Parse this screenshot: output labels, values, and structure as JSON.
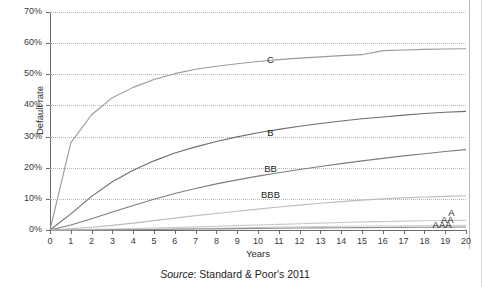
{
  "figure": {
    "source_prefix": "Source",
    "source_text": ": Standard & Poor's 2011"
  },
  "chart_data": {
    "type": "line",
    "title": "",
    "xlabel": "Years",
    "ylabel": "Default rate",
    "xlim": [
      0,
      20
    ],
    "ylim": [
      0,
      70
    ],
    "grid": true,
    "legend": "inline-labels",
    "x_ticks": [
      "0",
      "1",
      "2",
      "3",
      "4",
      "5",
      "6",
      "7",
      "8",
      "9",
      "10",
      "11",
      "12",
      "13",
      "14",
      "15",
      "16",
      "17",
      "18",
      "19",
      "20"
    ],
    "y_ticks": [
      "0%",
      "10%",
      "20%",
      "30%",
      "40%",
      "50%",
      "60%",
      "70%"
    ],
    "x": [
      0,
      1,
      2,
      3,
      4,
      5,
      6,
      7,
      8,
      9,
      10,
      11,
      12,
      13,
      14,
      15,
      16,
      17,
      18,
      19,
      20
    ],
    "series": [
      {
        "name": "C",
        "label": "C",
        "color": "#9a9a9a",
        "label_x": 10.6,
        "label_y": 54.5,
        "values": [
          0,
          28.0,
          37.0,
          42.5,
          45.8,
          48.3,
          50.2,
          51.6,
          52.6,
          53.4,
          54.1,
          54.7,
          55.2,
          55.6,
          56.0,
          56.3,
          57.6,
          57.8,
          58.0,
          58.1,
          58.2
        ]
      },
      {
        "name": "B",
        "label": "B",
        "color": "#6e6e6e",
        "label_x": 10.6,
        "label_y": 31.2,
        "values": [
          0,
          5.2,
          10.8,
          15.5,
          19.2,
          22.2,
          24.7,
          26.7,
          28.4,
          29.9,
          31.2,
          32.3,
          33.3,
          34.2,
          35.0,
          35.7,
          36.3,
          36.9,
          37.4,
          37.8,
          38.1
        ]
      },
      {
        "name": "BB",
        "label": "BB",
        "color": "#7d7d7d",
        "label_x": 10.6,
        "label_y": 19.6,
        "values": [
          0,
          1.6,
          3.6,
          5.8,
          7.9,
          9.9,
          11.7,
          13.3,
          14.8,
          16.1,
          17.3,
          18.4,
          19.4,
          20.4,
          21.3,
          22.2,
          23.0,
          23.8,
          24.5,
          25.2,
          25.8
        ]
      },
      {
        "name": "BBB",
        "label": "BBB",
        "color": "#bdbdbd",
        "label_x": 10.6,
        "label_y": 11.3,
        "values": [
          0,
          0.4,
          0.9,
          1.5,
          2.2,
          3.0,
          3.8,
          4.6,
          5.3,
          6.0,
          6.7,
          7.4,
          8.0,
          8.6,
          9.1,
          9.6,
          10.0,
          10.3,
          10.6,
          10.8,
          11.0
        ]
      },
      {
        "name": "A",
        "label": "A",
        "color": "#c9c9c9",
        "label_x": 19.3,
        "label_y": 5.6,
        "values": [
          0,
          0.1,
          0.2,
          0.3,
          0.45,
          0.6,
          0.8,
          1.0,
          1.2,
          1.4,
          1.6,
          1.8,
          2.0,
          2.2,
          2.4,
          2.6,
          2.7,
          2.85,
          2.95,
          3.05,
          3.1
        ]
      },
      {
        "name": "AA",
        "label": "AA",
        "color": "#d2d2d2",
        "label_x": 19.1,
        "label_y": 3.3,
        "values": [
          0,
          0.03,
          0.07,
          0.12,
          0.2,
          0.28,
          0.37,
          0.47,
          0.58,
          0.7,
          0.82,
          0.93,
          1.03,
          1.12,
          1.2,
          1.27,
          1.33,
          1.38,
          1.43,
          1.47,
          1.5
        ]
      },
      {
        "name": "AAA",
        "label": "AAA",
        "color": "#8f8f8f",
        "label_x": 18.85,
        "label_y": 1.5,
        "values": [
          0,
          0.0,
          0.02,
          0.05,
          0.1,
          0.16,
          0.23,
          0.3,
          0.37,
          0.44,
          0.51,
          0.57,
          0.63,
          0.68,
          0.73,
          0.77,
          0.81,
          0.85,
          0.88,
          0.91,
          0.94
        ]
      }
    ]
  }
}
